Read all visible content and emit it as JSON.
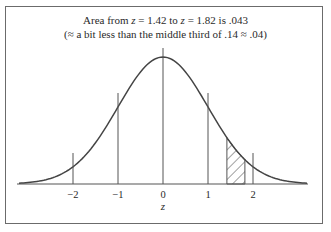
{
  "chart_data": {
    "type": "line",
    "title": "Area from z = 1.42 to z = 1.82 is .043",
    "subtitle": "(≈ a bit less than the middle third of .14 ≈ .04)",
    "xlabel": "z",
    "ylabel": "",
    "x_ticks": [
      -2,
      -1,
      0,
      1,
      2
    ],
    "tick_labels": [
      "−2",
      "−1",
      "0",
      "1",
      "2"
    ],
    "xlim": [
      -3.2,
      3.2
    ],
    "curve": "standard normal density",
    "shaded_region": {
      "from": 1.42,
      "to": 1.82,
      "area": 0.043,
      "pattern": "diagonal hatch"
    },
    "vertical_lines_at": [
      -2,
      -1,
      0,
      1,
      2
    ],
    "grid": false,
    "legend": null
  },
  "title_parts": {
    "prefix": "Area from ",
    "z1_var": "z",
    "z1_eq": " = 1.42 to ",
    "z2_var": "z",
    "z2_eq": " = 1.82 is .043"
  },
  "subtitle": "(≈ a bit less than the middle third of .14 ≈ .04)"
}
